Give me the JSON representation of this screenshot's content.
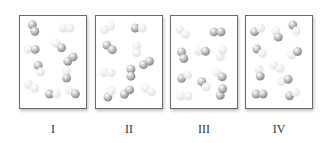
{
  "figure": {
    "colors": {
      "dark": "#8a8a8a",
      "light": "#e2e2e2",
      "border": "#6a6a6a"
    },
    "panels": [
      {
        "label": "I",
        "molecules": [
          {
            "x": 14,
            "y": 12,
            "a": "dark",
            "b": "dark",
            "angle": 70
          },
          {
            "x": 48,
            "y": 12,
            "a": "light",
            "b": "light",
            "angle": 0
          },
          {
            "x": 12,
            "y": 34,
            "a": "light",
            "b": "dark",
            "angle": 0
          },
          {
            "x": 40,
            "y": 30,
            "a": "light",
            "b": "dark",
            "angle": 40
          },
          {
            "x": 52,
            "y": 44,
            "a": "dark",
            "b": "dark",
            "angle": -40
          },
          {
            "x": 20,
            "y": 54,
            "a": "dark",
            "b": "light",
            "angle": 70
          },
          {
            "x": 48,
            "y": 60,
            "a": "light",
            "b": "dark",
            "angle": 90
          },
          {
            "x": 12,
            "y": 72,
            "a": "light",
            "b": "light",
            "angle": 30
          },
          {
            "x": 34,
            "y": 80,
            "a": "dark",
            "b": "light",
            "angle": 0
          },
          {
            "x": 54,
            "y": 78,
            "a": "light",
            "b": "dark",
            "angle": 30
          }
        ]
      },
      {
        "label": "II",
        "molecules": [
          {
            "x": 12,
            "y": 12,
            "a": "light",
            "b": "light",
            "angle": -30
          },
          {
            "x": 44,
            "y": 12,
            "a": "dark",
            "b": "light",
            "angle": 0
          },
          {
            "x": 14,
            "y": 32,
            "a": "dark",
            "b": "dark",
            "angle": 40
          },
          {
            "x": 42,
            "y": 34,
            "a": "light",
            "b": "light",
            "angle": 90
          },
          {
            "x": 52,
            "y": 48,
            "a": "dark",
            "b": "dark",
            "angle": -30
          },
          {
            "x": 12,
            "y": 58,
            "a": "light",
            "b": "light",
            "angle": 0
          },
          {
            "x": 36,
            "y": 58,
            "a": "dark",
            "b": "dark",
            "angle": 90
          },
          {
            "x": 14,
            "y": 80,
            "a": "dark",
            "b": "light",
            "angle": -60
          },
          {
            "x": 32,
            "y": 78,
            "a": "dark",
            "b": "dark",
            "angle": -40
          },
          {
            "x": 54,
            "y": 76,
            "a": "light",
            "b": "light",
            "angle": 30
          }
        ]
      },
      {
        "label": "III",
        "molecules": [
          {
            "x": 12,
            "y": 16,
            "a": "light",
            "b": "light",
            "angle": 40
          },
          {
            "x": 48,
            "y": 16,
            "a": "dark",
            "b": "dark",
            "angle": 0
          },
          {
            "x": 12,
            "y": 40,
            "a": "dark",
            "b": "dark",
            "angle": 70
          },
          {
            "x": 32,
            "y": 36,
            "a": "light",
            "b": "dark",
            "angle": 0
          },
          {
            "x": 52,
            "y": 38,
            "a": "light",
            "b": "light",
            "angle": -70
          },
          {
            "x": 14,
            "y": 62,
            "a": "dark",
            "b": "light",
            "angle": -30
          },
          {
            "x": 34,
            "y": 70,
            "a": "dark",
            "b": "light",
            "angle": 50
          },
          {
            "x": 50,
            "y": 60,
            "a": "light",
            "b": "dark",
            "angle": 40
          },
          {
            "x": 14,
            "y": 82,
            "a": "light",
            "b": "light",
            "angle": 0
          },
          {
            "x": 52,
            "y": 78,
            "a": "dark",
            "b": "dark",
            "angle": -70
          }
        ]
      },
      {
        "label": "IV",
        "molecules": [
          {
            "x": 12,
            "y": 14,
            "a": "dark",
            "b": "light",
            "angle": -30
          },
          {
            "x": 32,
            "y": 18,
            "a": "light",
            "b": "dark",
            "angle": 70
          },
          {
            "x": 50,
            "y": 12,
            "a": "dark",
            "b": "light",
            "angle": 60
          },
          {
            "x": 14,
            "y": 36,
            "a": "dark",
            "b": "light",
            "angle": 40
          },
          {
            "x": 50,
            "y": 38,
            "a": "light",
            "b": "dark",
            "angle": -30
          },
          {
            "x": 14,
            "y": 58,
            "a": "light",
            "b": "dark",
            "angle": 80
          },
          {
            "x": 32,
            "y": 52,
            "a": "light",
            "b": "light",
            "angle": 30
          },
          {
            "x": 40,
            "y": 66,
            "a": "light",
            "b": "dark",
            "angle": -20
          },
          {
            "x": 14,
            "y": 80,
            "a": "dark",
            "b": "dark",
            "angle": 0
          },
          {
            "x": 48,
            "y": 80,
            "a": "dark",
            "b": "light",
            "angle": -30
          }
        ]
      }
    ]
  }
}
